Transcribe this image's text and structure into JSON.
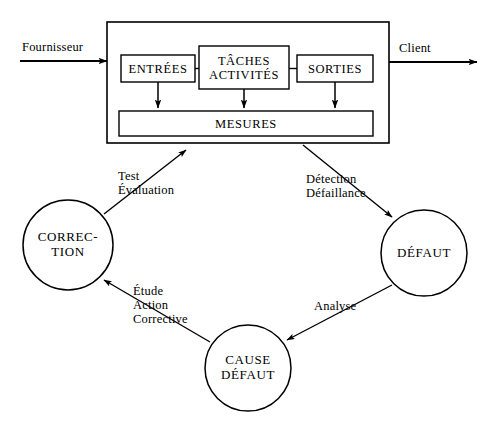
{
  "diagram": {
    "background_color": "#ffffff",
    "stroke_color": "#000000",
    "process_box": {
      "name": "process-container",
      "inner_boxes": [
        {
          "id": "entrees",
          "label": "ENTRÉES"
        },
        {
          "id": "taches",
          "label": "TÂCHES\nACTIVITÉS"
        },
        {
          "id": "sorties",
          "label": "SORTIES"
        },
        {
          "id": "mesures",
          "label": "MESURES"
        }
      ]
    },
    "external_labels": {
      "supplier": "Fournisseur",
      "customer": "Client"
    },
    "nodes": [
      {
        "id": "correction",
        "label": "CORREC-\nTION"
      },
      {
        "id": "defaut",
        "label": "DÉFAUT"
      },
      {
        "id": "cause_defaut",
        "label": "CAUSE\nDÉFAUT"
      }
    ],
    "edge_labels": [
      {
        "id": "test_evaluation",
        "label": "Test\nÉvaluation"
      },
      {
        "id": "detection_defaillance",
        "label": "Détection\nDéfaillance"
      },
      {
        "id": "etude_action_corrective",
        "label": "Étude\nAction\nCorrective"
      },
      {
        "id": "analyse",
        "label": "Analyse"
      }
    ]
  }
}
